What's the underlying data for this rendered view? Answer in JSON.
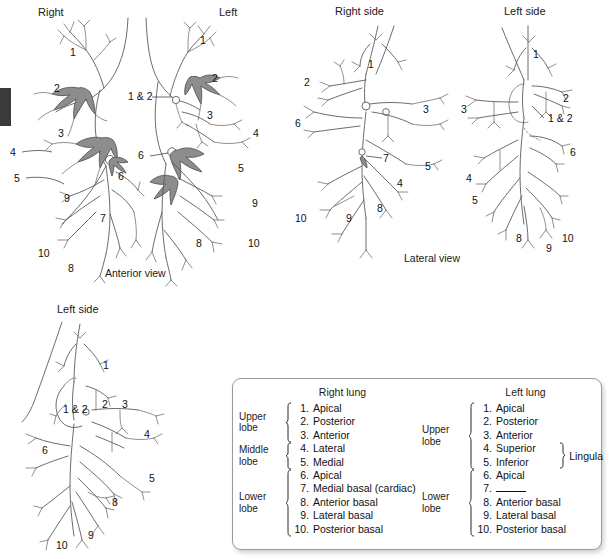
{
  "figure": {
    "panels": [
      {
        "id": "anterior",
        "header_left": "Right",
        "header_right": "Left",
        "caption": "Anterior view",
        "labels_right_lung": [
          "1",
          "2",
          "3",
          "4",
          "5",
          "6",
          "7",
          "8",
          "9",
          "10"
        ],
        "labels_left_lung": [
          "1",
          "1 & 2",
          "2",
          "3",
          "4",
          "5",
          "6",
          "8",
          "9",
          "10"
        ]
      },
      {
        "id": "lateral-right",
        "header": "Right side",
        "caption": "Lateral view",
        "labels": [
          "1",
          "2",
          "3",
          "4",
          "5",
          "6",
          "7",
          "8",
          "9",
          "10"
        ]
      },
      {
        "id": "lateral-left",
        "header": "Left side",
        "labels": [
          "1",
          "1 & 2",
          "2",
          "3",
          "4",
          "5",
          "6",
          "8",
          "9",
          "10"
        ]
      },
      {
        "id": "bottom-left-side",
        "header": "Left side",
        "labels": [
          "1",
          "1 & 2",
          "2",
          "3",
          "4",
          "5",
          "6",
          "8",
          "9",
          "10"
        ]
      }
    ]
  },
  "legend": {
    "right_lung": {
      "title": "Right lung",
      "lobes": [
        {
          "name": "Upper lobe",
          "items": [
            {
              "num": "1.",
              "name": "Apical"
            },
            {
              "num": "2.",
              "name": "Posterior"
            },
            {
              "num": "3.",
              "name": "Anterior"
            }
          ]
        },
        {
          "name": "Middle lobe",
          "items": [
            {
              "num": "4.",
              "name": "Lateral"
            },
            {
              "num": "5.",
              "name": "Medial"
            }
          ]
        },
        {
          "name": "Lower lobe",
          "items": [
            {
              "num": "6.",
              "name": "Apical"
            },
            {
              "num": "7.",
              "name": "Medial basal (cardiac)"
            },
            {
              "num": "8.",
              "name": "Anterior basal"
            },
            {
              "num": "9.",
              "name": "Lateral basal"
            },
            {
              "num": "10.",
              "name": "Posterior basal"
            }
          ]
        }
      ]
    },
    "left_lung": {
      "title": "Left lung",
      "lingula_label": "Lingula",
      "lobes": [
        {
          "name": "Upper lobe",
          "items": [
            {
              "num": "1.",
              "name": "Apical"
            },
            {
              "num": "2.",
              "name": "Posterior"
            },
            {
              "num": "3.",
              "name": "Anterior"
            },
            {
              "num": "4.",
              "name": "Superior"
            },
            {
              "num": "5.",
              "name": "Inferior"
            }
          ]
        },
        {
          "name": "Lower lobe",
          "items": [
            {
              "num": "6.",
              "name": "Apical"
            },
            {
              "num": "7.",
              "name": ""
            },
            {
              "num": "8.",
              "name": "Anterior basal"
            },
            {
              "num": "9.",
              "name": "Lateral basal"
            },
            {
              "num": "10.",
              "name": "Posterior basal"
            }
          ]
        }
      ]
    }
  },
  "colors": {
    "stroke": "#5b5b5b",
    "shaded_bronchus": "#8d8d8d",
    "text": "#111111",
    "legend_border": "#9a9a9a"
  }
}
